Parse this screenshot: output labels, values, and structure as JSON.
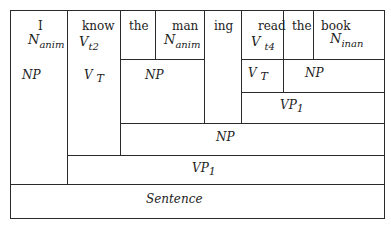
{
  "diagram": {
    "type": "sentence-structure box diagram",
    "words": [
      {
        "word": "I",
        "category": "N",
        "subscript": "anim"
      },
      {
        "word": "know",
        "category": "V",
        "subscript": "t2"
      },
      {
        "word": "the",
        "category": "",
        "subscript": ""
      },
      {
        "word": "man",
        "category": "N",
        "subscript": "anim"
      },
      {
        "word": "ing",
        "category": "",
        "subscript": ""
      },
      {
        "word": "read",
        "category": "V",
        "subscript": "t4"
      },
      {
        "word": "the",
        "category": "",
        "subscript": ""
      },
      {
        "word": "book",
        "category": "N",
        "subscript": "inan"
      }
    ],
    "phrases": {
      "np_i": "NP",
      "vt_know": "V",
      "vt_know_sub": "T",
      "np_the_man": "NP",
      "vt_read": "V",
      "vt_read_sub": "T",
      "np_the_book": "NP",
      "vp1_inner": "VP",
      "vp1_inner_sub": "1",
      "np_big": "NP",
      "vp1_outer": "VP",
      "vp1_outer_sub": "1",
      "sentence": "Sentence"
    }
  }
}
